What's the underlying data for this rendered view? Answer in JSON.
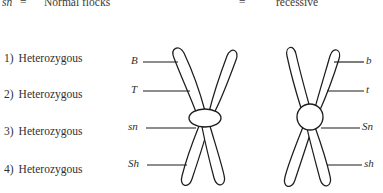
{
  "legend": {
    "symbol": "sn",
    "equals_left": "=",
    "meaning": "Normal flocks",
    "equals_right": "=",
    "trait": "recessive"
  },
  "zygosity_list": [
    {
      "number": "1)",
      "label": "Heterozygous"
    },
    {
      "number": "2)",
      "label": "Heterozygous"
    },
    {
      "number": "3)",
      "label": "Heterozygous"
    },
    {
      "number": "4)",
      "label": "Heterozygous"
    }
  ],
  "chromosomes": {
    "left": {
      "name": "left-chromosome",
      "centromere_shape": "ellipse",
      "alleles": [
        "B",
        "T",
        "sn",
        "Sh"
      ]
    },
    "right": {
      "name": "right-chromosome",
      "centromere_shape": "circle",
      "alleles": [
        "b",
        "t",
        "Sn",
        "sh"
      ]
    }
  },
  "colors": {
    "ink": "#1d1d1d",
    "text": "#2f2f2f",
    "background": "#ffffff"
  }
}
